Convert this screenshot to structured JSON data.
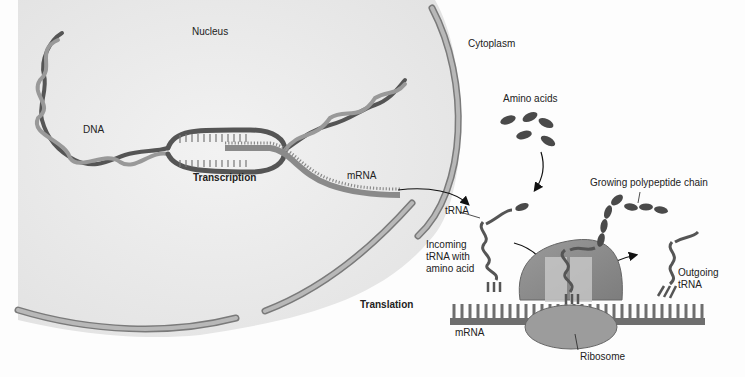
{
  "diagram": {
    "regions": {
      "nucleus": "Nucleus",
      "cytoplasm": "Cytoplasm"
    },
    "labels": {
      "dna": "DNA",
      "transcription": "Transcription",
      "mrna_top": "mRNA",
      "amino_acids": "Amino acids",
      "growing_chain": "Growing polypeptide chain",
      "trna": "tRNA",
      "incoming_1": "Incoming",
      "incoming_2": "tRNA with",
      "incoming_3": "amino acid",
      "outgoing_1": "Outgoing",
      "outgoing_2": "tRNA",
      "translation": "Translation",
      "mrna_bottom": "mRNA",
      "ribosome": "Ribosome"
    },
    "colors": {
      "nucleus_fill": "#e6e6e6",
      "membrane": "#9a9a9a",
      "membrane_outline": "#7a7a7a",
      "dna_dark": "#555555",
      "dna_light": "#8c8c8c",
      "amino_acid": "#4a4a4a",
      "ribosome": "#8f8f8f",
      "ribosome_lower": "#9c9c9c"
    }
  }
}
